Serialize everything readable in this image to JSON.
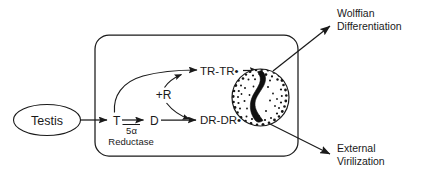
{
  "figure": {
    "background_color": "#ffffff",
    "ink_color": "#1a1a1a"
  },
  "source": {
    "label": "Testis",
    "shape": "ellipse"
  },
  "cell": {
    "shape": "rounded-rectangle",
    "label": ""
  },
  "pathway": {
    "testosterone": "T",
    "enzyme_symbol": "5α",
    "enzyme_name": "Reductase",
    "dihydrotestosterone": "D",
    "receptor": "+R",
    "t_receptor_complex": "TR-TR•",
    "d_receptor_complex": "DR-DR•"
  },
  "nucleus": {
    "name": "nucleus",
    "contents": "DNA"
  },
  "outcomes": [
    {
      "id": "wolffian",
      "line1": "Wolffian",
      "line2": "Differentiation"
    },
    {
      "id": "external",
      "line1": "External",
      "line2": "Virilization"
    }
  ]
}
